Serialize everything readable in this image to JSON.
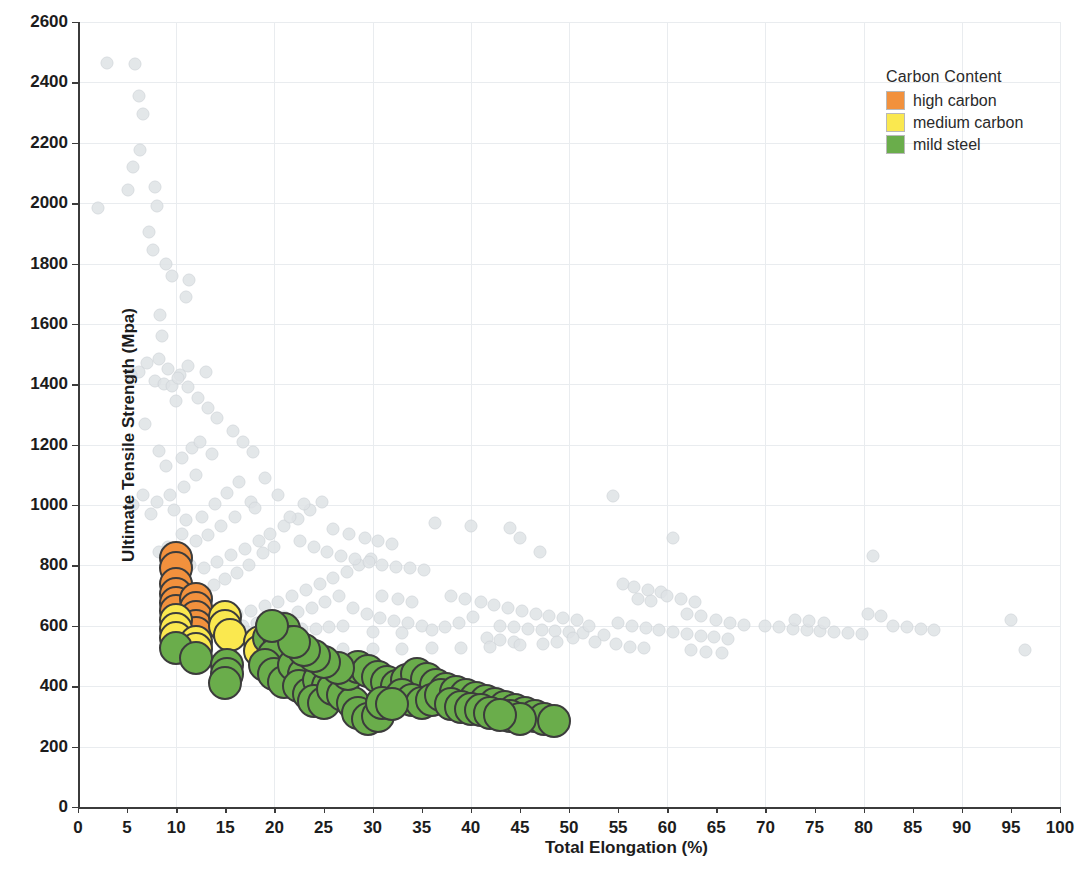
{
  "chart_data": {
    "type": "scatter",
    "title": "",
    "xlabel": "Total Elongation (%)",
    "ylabel": "Ultimate Tensile Strength (Mpa)",
    "xlim": [
      0,
      100
    ],
    "ylim": [
      0,
      2600
    ],
    "xticks": [
      0,
      5,
      10,
      15,
      20,
      25,
      30,
      35,
      40,
      45,
      50,
      55,
      60,
      65,
      70,
      75,
      80,
      85,
      90,
      95,
      100
    ],
    "yticks": [
      0,
      200,
      400,
      600,
      800,
      1000,
      1200,
      1400,
      1600,
      1800,
      2000,
      2200,
      2400,
      2600
    ],
    "grid": true,
    "legend": {
      "title": "Carbon Content",
      "position": "top-right",
      "entries": [
        {
          "label": "high carbon",
          "color": "#f2913d",
          "key": "high"
        },
        {
          "label": "medium carbon",
          "color": "#fae84f",
          "key": "medium"
        },
        {
          "label": "mild steel",
          "color": "#6aad4b",
          "key": "mild"
        }
      ]
    },
    "background_series": {
      "name": "unhighlighted steels",
      "color": "#dfe3e6",
      "marker_size": 11,
      "points": [
        [
          2.0,
          1985
        ],
        [
          3.0,
          2465
        ],
        [
          5.8,
          2462
        ],
        [
          6.2,
          2355
        ],
        [
          6.6,
          2295
        ],
        [
          6.3,
          2175
        ],
        [
          5.6,
          2120
        ],
        [
          5.1,
          2045
        ],
        [
          7.8,
          2055
        ],
        [
          8.0,
          1990
        ],
        [
          7.2,
          1905
        ],
        [
          7.6,
          1845
        ],
        [
          9.0,
          1800
        ],
        [
          9.6,
          1760
        ],
        [
          11.3,
          1745
        ],
        [
          11.0,
          1690
        ],
        [
          8.4,
          1630
        ],
        [
          8.6,
          1560
        ],
        [
          7.0,
          1470
        ],
        [
          6.2,
          1440
        ],
        [
          5.4,
          1430
        ],
        [
          7.8,
          1410
        ],
        [
          8.8,
          1400
        ],
        [
          9.6,
          1395
        ],
        [
          10.4,
          1430
        ],
        [
          11.2,
          1460
        ],
        [
          13.0,
          1440
        ],
        [
          10.0,
          1345
        ],
        [
          6.8,
          1270
        ],
        [
          8.2,
          1180
        ],
        [
          9.0,
          1130
        ],
        [
          10.6,
          1155
        ],
        [
          11.6,
          1190
        ],
        [
          12.4,
          1210
        ],
        [
          13.6,
          1170
        ],
        [
          12.0,
          1100
        ],
        [
          10.8,
          1060
        ],
        [
          9.4,
          1035
        ],
        [
          8.0,
          1010
        ],
        [
          6.6,
          1035
        ],
        [
          5.6,
          1000
        ],
        [
          7.4,
          970
        ],
        [
          9.8,
          985
        ],
        [
          11.0,
          950
        ],
        [
          12.6,
          960
        ],
        [
          14.0,
          1005
        ],
        [
          15.2,
          1040
        ],
        [
          16.4,
          1075
        ],
        [
          17.6,
          1010
        ],
        [
          16.0,
          960
        ],
        [
          14.6,
          930
        ],
        [
          13.2,
          900
        ],
        [
          12.0,
          880
        ],
        [
          10.6,
          905
        ],
        [
          9.2,
          860
        ],
        [
          8.2,
          845
        ],
        [
          10.0,
          820
        ],
        [
          11.4,
          800
        ],
        [
          12.8,
          790
        ],
        [
          14.2,
          810
        ],
        [
          15.6,
          835
        ],
        [
          17.0,
          855
        ],
        [
          18.4,
          880
        ],
        [
          19.6,
          905
        ],
        [
          21.0,
          930
        ],
        [
          22.4,
          955
        ],
        [
          23.6,
          985
        ],
        [
          24.8,
          1010
        ],
        [
          20.0,
          860
        ],
        [
          18.8,
          840
        ],
        [
          17.4,
          800
        ],
        [
          16.2,
          775
        ],
        [
          15.0,
          755
        ],
        [
          13.8,
          735
        ],
        [
          12.6,
          715
        ],
        [
          11.4,
          700
        ],
        [
          10.2,
          690
        ],
        [
          9.0,
          680
        ],
        [
          12.0,
          660
        ],
        [
          13.4,
          650
        ],
        [
          14.8,
          645
        ],
        [
          16.2,
          640
        ],
        [
          17.6,
          650
        ],
        [
          19.0,
          665
        ],
        [
          20.4,
          680
        ],
        [
          21.8,
          700
        ],
        [
          23.2,
          720
        ],
        [
          24.6,
          740
        ],
        [
          26.0,
          760
        ],
        [
          27.4,
          780
        ],
        [
          28.6,
          800
        ],
        [
          29.8,
          820
        ],
        [
          26.6,
          700
        ],
        [
          25.2,
          680
        ],
        [
          23.8,
          660
        ],
        [
          22.4,
          645
        ],
        [
          21.0,
          630
        ],
        [
          19.6,
          620
        ],
        [
          18.2,
          610
        ],
        [
          16.8,
          600
        ],
        [
          15.4,
          595
        ],
        [
          14.0,
          590
        ],
        [
          12.8,
          585
        ],
        [
          11.6,
          582
        ],
        [
          28.0,
          660
        ],
        [
          29.4,
          640
        ],
        [
          30.8,
          625
        ],
        [
          32.2,
          615
        ],
        [
          33.6,
          608
        ],
        [
          35.0,
          600
        ],
        [
          31.0,
          700
        ],
        [
          32.6,
          690
        ],
        [
          34.0,
          680
        ],
        [
          27.0,
          600
        ],
        [
          25.6,
          595
        ],
        [
          24.2,
          590
        ],
        [
          22.8,
          588
        ],
        [
          21.4,
          586
        ],
        [
          20.0,
          584
        ],
        [
          18.6,
          582
        ],
        [
          17.2,
          580
        ],
        [
          30.0,
          580
        ],
        [
          33.0,
          575
        ],
        [
          36.0,
          585
        ],
        [
          37.4,
          595
        ],
        [
          38.8,
          610
        ],
        [
          40.2,
          630
        ],
        [
          36.4,
          940
        ],
        [
          40.0,
          930
        ],
        [
          45.0,
          890
        ],
        [
          44.0,
          925
        ],
        [
          47.0,
          845
        ],
        [
          38.0,
          700
        ],
        [
          39.4,
          690
        ],
        [
          41.0,
          680
        ],
        [
          42.4,
          670
        ],
        [
          43.8,
          660
        ],
        [
          45.2,
          650
        ],
        [
          46.6,
          640
        ],
        [
          48.0,
          632
        ],
        [
          49.4,
          625
        ],
        [
          50.8,
          618
        ],
        [
          43.0,
          600
        ],
        [
          44.4,
          595
        ],
        [
          45.8,
          590
        ],
        [
          47.2,
          586
        ],
        [
          48.6,
          582
        ],
        [
          50.0,
          578
        ],
        [
          51.4,
          575
        ],
        [
          41.6,
          560
        ],
        [
          43.0,
          552
        ],
        [
          44.4,
          545
        ],
        [
          54.5,
          1030
        ],
        [
          55.5,
          740
        ],
        [
          56.6,
          730
        ],
        [
          58.0,
          720
        ],
        [
          59.4,
          712
        ],
        [
          57.0,
          690
        ],
        [
          58.4,
          682
        ],
        [
          60.0,
          700
        ],
        [
          61.4,
          688
        ],
        [
          62.8,
          678
        ],
        [
          55.0,
          610
        ],
        [
          56.4,
          600
        ],
        [
          57.8,
          592
        ],
        [
          59.2,
          585
        ],
        [
          60.6,
          578
        ],
        [
          62.0,
          572
        ],
        [
          63.4,
          566
        ],
        [
          64.8,
          562
        ],
        [
          66.2,
          558
        ],
        [
          53.6,
          570
        ],
        [
          54.8,
          540
        ],
        [
          56.2,
          530
        ],
        [
          57.6,
          525
        ],
        [
          60.6,
          890
        ],
        [
          62.0,
          640
        ],
        [
          63.4,
          632
        ],
        [
          65.0,
          620
        ],
        [
          66.4,
          610
        ],
        [
          67.8,
          602
        ],
        [
          62.4,
          520
        ],
        [
          64.0,
          515
        ],
        [
          65.6,
          510
        ],
        [
          70.0,
          600
        ],
        [
          71.4,
          595
        ],
        [
          72.8,
          590
        ],
        [
          74.2,
          586
        ],
        [
          75.6,
          582
        ],
        [
          77.0,
          578
        ],
        [
          78.4,
          575
        ],
        [
          79.8,
          572
        ],
        [
          73.0,
          620
        ],
        [
          74.4,
          615
        ],
        [
          76.0,
          610
        ],
        [
          81.0,
          830
        ],
        [
          80.4,
          640
        ],
        [
          81.8,
          632
        ],
        [
          83.0,
          600
        ],
        [
          84.4,
          595
        ],
        [
          85.8,
          590
        ],
        [
          87.2,
          586
        ],
        [
          95.0,
          620
        ],
        [
          96.4,
          520
        ],
        [
          52.0,
          600
        ],
        [
          52.6,
          545
        ],
        [
          50.4,
          560
        ],
        [
          48.8,
          548
        ],
        [
          47.4,
          540
        ],
        [
          45.0,
          535
        ],
        [
          42.0,
          530
        ],
        [
          39.0,
          528
        ],
        [
          36.0,
          525
        ],
        [
          33.0,
          524
        ],
        [
          30.0,
          523
        ],
        [
          27.0,
          522
        ],
        [
          24.0,
          521
        ],
        [
          21.0,
          520
        ],
        [
          18.0,
          519
        ],
        [
          15.0,
          518
        ],
        [
          13.0,
          520
        ],
        [
          11.0,
          525
        ],
        [
          19.0,
          1090
        ],
        [
          20.4,
          1035
        ],
        [
          18.0,
          990
        ],
        [
          21.6,
          960
        ],
        [
          23.0,
          1005
        ],
        [
          15.8,
          1245
        ],
        [
          16.8,
          1210
        ],
        [
          17.8,
          1175
        ],
        [
          14.2,
          1290
        ],
        [
          13.2,
          1320
        ],
        [
          12.2,
          1355
        ],
        [
          11.2,
          1390
        ],
        [
          10.2,
          1420
        ],
        [
          9.2,
          1450
        ],
        [
          8.2,
          1485
        ],
        [
          22.6,
          880
        ],
        [
          24.0,
          860
        ],
        [
          25.4,
          845
        ],
        [
          26.8,
          832
        ],
        [
          28.2,
          820
        ],
        [
          29.6,
          810
        ],
        [
          31.0,
          802
        ],
        [
          32.4,
          795
        ],
        [
          33.8,
          790
        ],
        [
          35.2,
          786
        ],
        [
          26.0,
          920
        ],
        [
          27.6,
          905
        ],
        [
          29.2,
          892
        ],
        [
          30.6,
          880
        ],
        [
          32.0,
          870
        ]
      ]
    },
    "highlighted_series": [
      {
        "name": "high carbon",
        "color": "#f2913d",
        "marker_size": 30,
        "points": [
          [
            10.0,
            825
          ],
          [
            10.0,
            790
          ],
          [
            10.0,
            740
          ],
          [
            10.0,
            705
          ],
          [
            10.0,
            675
          ],
          [
            10.0,
            650
          ],
          [
            12.0,
            690
          ],
          [
            12.0,
            660
          ],
          [
            12.0,
            630
          ],
          [
            12.0,
            600
          ],
          [
            12.0,
            575
          ]
        ]
      },
      {
        "name": "medium carbon",
        "color": "#fae84f",
        "marker_size": 30,
        "points": [
          [
            10.0,
            620
          ],
          [
            10.0,
            590
          ],
          [
            10.0,
            560
          ],
          [
            12.0,
            548
          ],
          [
            12.0,
            522
          ],
          [
            15.0,
            630
          ],
          [
            15.0,
            600
          ],
          [
            15.5,
            570
          ],
          [
            18.5,
            545
          ],
          [
            18.5,
            518
          ]
        ]
      },
      {
        "name": "mild steel",
        "color": "#6aad4b",
        "marker_size": 30,
        "points": [
          [
            10.0,
            525
          ],
          [
            12.0,
            495
          ],
          [
            15.2,
            470
          ],
          [
            15.2,
            440
          ],
          [
            15.0,
            410
          ],
          [
            19.5,
            560
          ],
          [
            20.5,
            565
          ],
          [
            21.0,
            590
          ],
          [
            21.5,
            545
          ],
          [
            20.0,
            505
          ],
          [
            19.0,
            470
          ],
          [
            20.0,
            440
          ],
          [
            21.0,
            415
          ],
          [
            22.0,
            470
          ],
          [
            23.0,
            440
          ],
          [
            22.5,
            400
          ],
          [
            23.5,
            375
          ],
          [
            24.5,
            420
          ],
          [
            25.5,
            400
          ],
          [
            24.0,
            350
          ],
          [
            25.0,
            345
          ],
          [
            26.0,
            390
          ],
          [
            27.0,
            370
          ],
          [
            28.0,
            345
          ],
          [
            28.5,
            310
          ],
          [
            29.5,
            290
          ],
          [
            30.5,
            300
          ],
          [
            27.5,
            440
          ],
          [
            28.5,
            465
          ],
          [
            29.5,
            450
          ],
          [
            30.5,
            430
          ],
          [
            31.5,
            415
          ],
          [
            32.5,
            400
          ],
          [
            33.5,
            420
          ],
          [
            34.5,
            440
          ],
          [
            35.5,
            425
          ],
          [
            36.5,
            405
          ],
          [
            37.5,
            390
          ],
          [
            33.0,
            370
          ],
          [
            34.0,
            355
          ],
          [
            35.0,
            345
          ],
          [
            36.0,
            355
          ],
          [
            37.0,
            370
          ],
          [
            38.5,
            380
          ],
          [
            39.5,
            370
          ],
          [
            40.5,
            360
          ],
          [
            41.5,
            350
          ],
          [
            42.5,
            340
          ],
          [
            38.0,
            340
          ],
          [
            39.0,
            330
          ],
          [
            40.0,
            325
          ],
          [
            41.0,
            320
          ],
          [
            43.5,
            330
          ],
          [
            44.5,
            320
          ],
          [
            45.5,
            310
          ],
          [
            46.5,
            300
          ],
          [
            47.5,
            290
          ],
          [
            48.5,
            285
          ],
          [
            44.0,
            300
          ],
          [
            45.0,
            292
          ],
          [
            42.0,
            310
          ],
          [
            43.0,
            305
          ],
          [
            31.0,
            345
          ],
          [
            32.0,
            340
          ],
          [
            26.5,
            460
          ],
          [
            25.0,
            480
          ],
          [
            24.0,
            500
          ],
          [
            23.0,
            520
          ],
          [
            22.0,
            545
          ],
          [
            19.8,
            600
          ]
        ]
      }
    ]
  }
}
